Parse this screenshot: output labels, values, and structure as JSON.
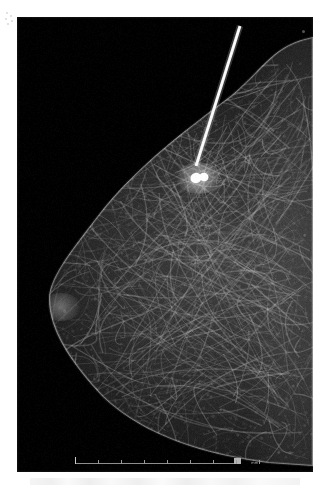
{
  "viewer": {
    "width": 331,
    "height": 489,
    "background_color": "#ffffff",
    "modality_label": "Mammogram"
  },
  "film": {
    "x": 17,
    "y": 17,
    "width": 296,
    "height": 455,
    "background_color": "#000000",
    "description": "Digital mammography image, breast in profile facing left, chest wall at right"
  },
  "overlays": {
    "fiducial_dot": {
      "name": "corner fiducial marker",
      "x": 285,
      "y": 13,
      "color": "#969696"
    },
    "margin_marks": {
      "name": "film registration marks",
      "count": 5,
      "color": "#d8d8d8"
    }
  },
  "scalebar": {
    "name": "ruler scale bar",
    "unit_label": "mm",
    "left": 58,
    "width": 165,
    "major_tick_count": 8,
    "tick_spacing_px": 23,
    "axis_color": "#8e8e8e",
    "tick_color": "#c9c9c9"
  },
  "anatomy": {
    "needle": {
      "label": "biopsy / localization needle",
      "color": "#f2f2f2",
      "tip_x": 196,
      "tip_y": 166,
      "entry_x": 240,
      "entry_y": 26,
      "width_px": 3
    },
    "lesion": {
      "label": "radiopaque lesion / clip marker",
      "color": "#ffffff",
      "center_x": 199,
      "center_y": 178,
      "radius_x": 9,
      "radius_y": 6
    },
    "tissue": {
      "label": "fibroglandular breast tissue",
      "highlight_color": "#b9b9b9",
      "base_color": "#171717"
    },
    "nipple": {
      "label": "nipple in profile",
      "x": 55,
      "y": 300
    }
  },
  "chart_data": {
    "type": "heatmap",
    "xlabel": "",
    "ylabel": "",
    "legend": [],
    "annotations": [
      "biopsy / localization needle",
      "radiopaque lesion / clip marker",
      "scale bar in mm"
    ]
  }
}
